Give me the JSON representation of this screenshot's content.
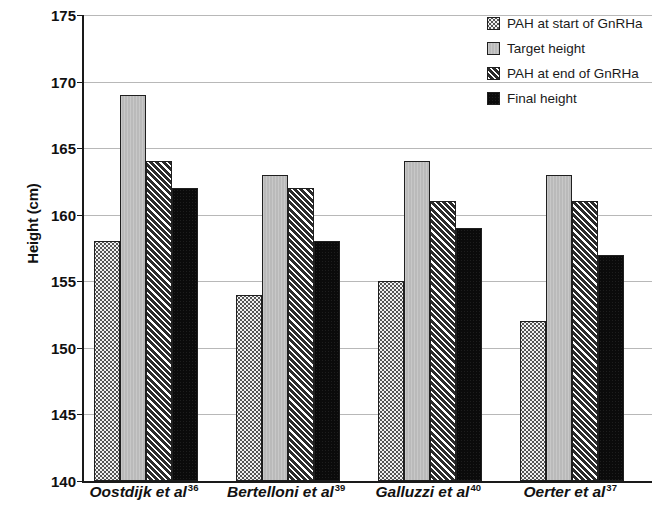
{
  "chart_data": {
    "type": "bar",
    "title": "",
    "subtitle": "",
    "xlabel": "",
    "ylabel": "Height (cm)",
    "ylim": [
      140,
      175
    ],
    "ytick_step": 5,
    "yticks": [
      175,
      170,
      165,
      160,
      155,
      150,
      145,
      140
    ],
    "grid": true,
    "grid_axis": "y",
    "legend_position": "top-right",
    "categories": [
      "Oostdijk et al",
      "Bertelloni et al",
      "Galluzzi et al",
      "Oerter et al"
    ],
    "category_refs": [
      "36",
      "39",
      "40",
      "37"
    ],
    "series": [
      {
        "name": "PAH at start of GnRHa",
        "pattern": "stipple",
        "color": "#f2f2f2",
        "values": [
          158,
          154,
          155,
          152
        ]
      },
      {
        "name": "Target height",
        "pattern": "solid-grey",
        "color": "#bdbdbd",
        "values": [
          169,
          163,
          164,
          163
        ]
      },
      {
        "name": "PAH at end of GnRHa",
        "pattern": "diagonal-hatch",
        "color": "#2b2b2b",
        "values": [
          164,
          162,
          161,
          161
        ]
      },
      {
        "name": "Final height",
        "pattern": "solid-black",
        "color": "#0b0b0b",
        "values": [
          162,
          158,
          159,
          157
        ]
      }
    ]
  },
  "axis": {
    "y_title": "Height (cm)"
  },
  "legend": {
    "items": [
      {
        "label": "PAH at start of GnRHa",
        "pattern": "stipple"
      },
      {
        "label": "Target height",
        "pattern": "solid-grey"
      },
      {
        "label": "PAH at end of GnRHa",
        "pattern": "diagonal-hatch"
      },
      {
        "label": "Final height",
        "pattern": "solid-black"
      }
    ]
  }
}
